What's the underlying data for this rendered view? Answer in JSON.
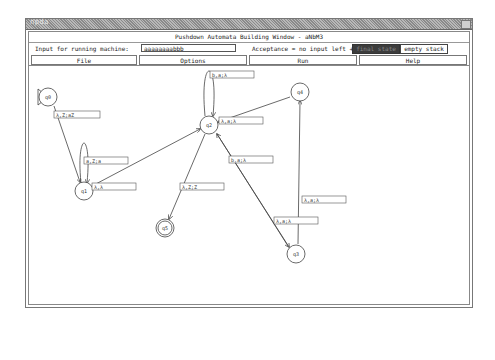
{
  "titlebar": {
    "app_name": "npda"
  },
  "window": {
    "heading": "Pushdown Automata Building Window -  aNbM3"
  },
  "input_row": {
    "label": "Input for running machine:",
    "value": "aaaaaaaabbb",
    "acceptance_label": "Acceptance = no input left +",
    "final_state_button": "final state",
    "empty_stack_button": "empty stack"
  },
  "menu": {
    "items": [
      "File",
      "Options",
      "Run",
      "Help"
    ]
  },
  "diagram": {
    "states": [
      {
        "id": "q0",
        "label": "q0",
        "x": 44,
        "y": 94,
        "initial": true,
        "final": false
      },
      {
        "id": "q1",
        "label": "q1",
        "x": 80,
        "y": 188,
        "initial": false,
        "final": false
      },
      {
        "id": "q2",
        "label": "q2",
        "x": 205,
        "y": 122,
        "initial": false,
        "final": false
      },
      {
        "id": "q3",
        "label": "q3",
        "x": 292,
        "y": 251,
        "initial": false,
        "final": false
      },
      {
        "id": "q4",
        "label": "q4",
        "x": 296,
        "y": 89,
        "initial": false,
        "final": false
      },
      {
        "id": "q5",
        "label": "q5",
        "x": 161,
        "y": 225,
        "initial": false,
        "final": true
      }
    ],
    "transitions": [
      {
        "from": "q0",
        "to": "q1",
        "label": "λ,Z;aZ",
        "lx": 50,
        "ly": 111
      },
      {
        "from": "q1",
        "to": "q1",
        "label": "a,Z;a",
        "lx": 80,
        "ly": 157
      },
      {
        "from": "q1",
        "to": "q2",
        "label": "λ,λ",
        "lx": 88,
        "ly": 183
      },
      {
        "from": "q2",
        "to": "q2",
        "label": "b,a;λ",
        "lx": 206,
        "ly": 71
      },
      {
        "from": "q4",
        "to": "q2",
        "label": "λ,a;λ",
        "lx": 215,
        "ly": 117
      },
      {
        "from": "q2",
        "to": "q5",
        "label": "λ,Z;Z",
        "lx": 176,
        "ly": 183
      },
      {
        "from": "q3",
        "to": "q2",
        "label": "b,a;λ",
        "lx": 225,
        "ly": 156
      },
      {
        "from": "q3",
        "to": "q4",
        "label": "λ,a;λ",
        "lx": 298,
        "ly": 196
      },
      {
        "from": "q2",
        "to": "q3",
        "label": "λ,a;λ",
        "lx": 270,
        "ly": 217
      }
    ]
  }
}
